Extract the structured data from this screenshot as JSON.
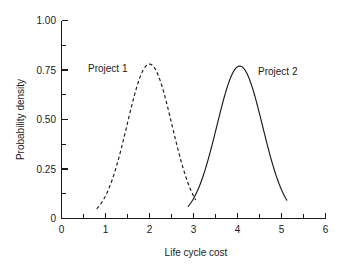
{
  "chart_data": {
    "type": "line",
    "title": "",
    "xlabel": "Life cycle cost",
    "ylabel": "Probability density",
    "xlim": [
      0,
      6
    ],
    "ylim": [
      0,
      1.0
    ],
    "grid": false,
    "legend_position": "inline-annotations",
    "x_ticks": [
      "0",
      "1",
      "2",
      "3",
      "4",
      "5",
      "6"
    ],
    "x_tick_values": [
      0,
      1,
      2,
      3,
      4,
      5,
      6
    ],
    "x_minor_ticks": [
      0.5,
      1.5,
      2.5,
      3.5,
      4.5,
      5.5
    ],
    "y_ticks": [
      "0",
      "0.25",
      "0.50",
      "0.75",
      "1.00"
    ],
    "y_tick_values": [
      0,
      0.25,
      0.5,
      0.75,
      1.0
    ],
    "y_minor_ticks": [
      0.125,
      0.375,
      0.625,
      0.875
    ],
    "series": [
      {
        "name": "Project 1",
        "style": "dashed",
        "color": "#1a1a1a",
        "distribution": "normal",
        "mean": 2.0,
        "std_dev": 0.51,
        "peak_value": 0.78,
        "x_start": 0.8,
        "x_end": 3.05,
        "x": [
          0.8,
          0.9,
          1.0,
          1.1,
          1.2,
          1.3,
          1.4,
          1.5,
          1.6,
          1.7,
          1.8,
          1.9,
          2.0,
          2.1,
          2.2,
          2.3,
          2.4,
          2.5,
          2.6,
          2.7,
          2.8,
          2.9,
          3.0,
          3.05
        ],
        "values": [
          0.07,
          0.1,
          0.14,
          0.19,
          0.25,
          0.32,
          0.41,
          0.5,
          0.59,
          0.68,
          0.74,
          0.78,
          0.78,
          0.78,
          0.74,
          0.68,
          0.59,
          0.5,
          0.41,
          0.32,
          0.25,
          0.19,
          0.14,
          0.12
        ],
        "label": "Project 1",
        "label_x": 1.35,
        "label_y": 0.8
      },
      {
        "name": "Project 2",
        "style": "solid",
        "color": "#1a1a1a",
        "distribution": "normal",
        "mean": 4.05,
        "std_dev": 0.52,
        "peak_value": 0.77,
        "x_start": 2.88,
        "x_end": 5.12,
        "x": [
          2.88,
          3.0,
          3.1,
          3.2,
          3.3,
          3.4,
          3.5,
          3.6,
          3.7,
          3.8,
          3.9,
          4.0,
          4.1,
          4.2,
          4.3,
          4.4,
          4.5,
          4.6,
          4.7,
          4.8,
          4.9,
          5.0,
          5.12
        ],
        "values": [
          0.07,
          0.11,
          0.15,
          0.2,
          0.26,
          0.33,
          0.42,
          0.51,
          0.6,
          0.68,
          0.74,
          0.77,
          0.77,
          0.74,
          0.68,
          0.6,
          0.51,
          0.42,
          0.33,
          0.26,
          0.16,
          0.11,
          0.07
        ],
        "label": "Project 2",
        "label_x": 4.55,
        "label_y": 0.73
      }
    ],
    "annotations": [
      {
        "text": "Project 1",
        "x": 1.35,
        "y": 0.8
      },
      {
        "text": "Project 2",
        "x": 4.55,
        "y": 0.73
      }
    ]
  },
  "axes": {
    "x_title": "Life cycle cost",
    "y_title": "Probability density",
    "x_tick_labels": {
      "t0": "0",
      "t1": "1",
      "t2": "2",
      "t3": "3",
      "t4": "4",
      "t5": "5",
      "t6": "6"
    },
    "y_tick_labels": {
      "t0": "0",
      "t1": "0.25",
      "t2": "0.50",
      "t3": "0.75",
      "t4": "1.00"
    }
  },
  "labels": {
    "project1": "Project 1",
    "project2": "Project 2"
  },
  "colors": {
    "ink": "#1a1a1a",
    "background": "#ffffff"
  }
}
